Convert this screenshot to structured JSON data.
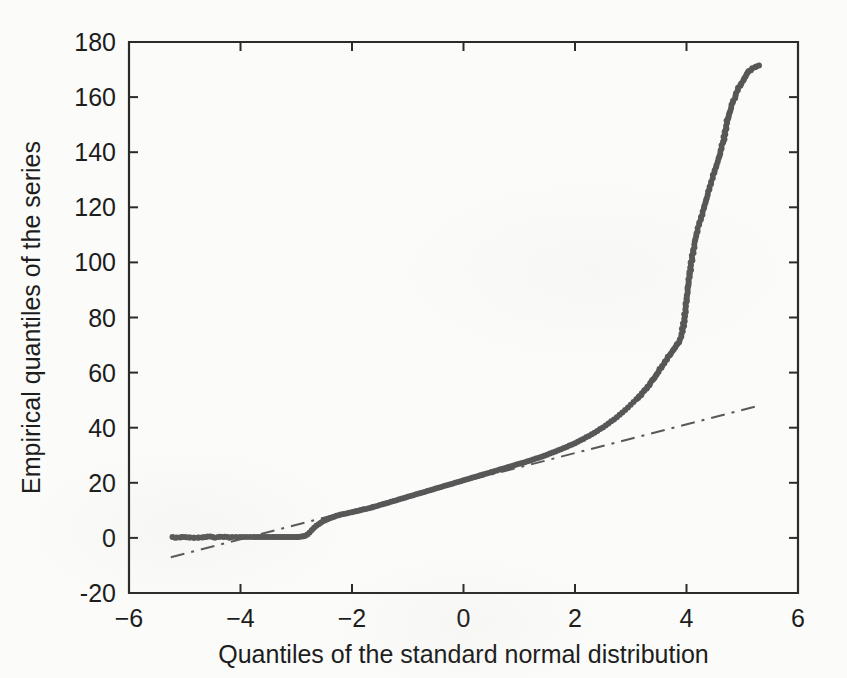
{
  "figure": {
    "background_color": "#fbfbf9",
    "axis_color": "#2b2b2b",
    "marker_color": "#575757",
    "reference_line_color": "#585858"
  },
  "chart_data": {
    "type": "scatter",
    "title": "",
    "xlabel": "Quantiles of the standard normal distribution",
    "ylabel": "Empirical quantiles of the series",
    "xlim": [
      -6,
      6
    ],
    "ylim": [
      -20,
      180
    ],
    "xticks": [
      -6,
      -4,
      -2,
      0,
      2,
      4,
      6
    ],
    "xticklabels": [
      "-6",
      "-4",
      "-2",
      "0",
      "2",
      "4",
      "6"
    ],
    "yticks": [
      -20,
      0,
      20,
      40,
      60,
      80,
      100,
      120,
      140,
      160,
      180
    ],
    "yticklabels": [
      "-20",
      "0",
      "20",
      "40",
      "60",
      "80",
      "100",
      "120",
      "140",
      "160",
      "180"
    ],
    "grid": false,
    "legend": null,
    "marker": "dot",
    "marker_size": 3.0,
    "series": [
      {
        "name": "Empirical quantiles",
        "type": "scatter",
        "points": [
          [
            -5.22,
            0.3
          ],
          [
            -5.05,
            0.3
          ],
          [
            -4.62,
            0.3
          ],
          [
            -4.5,
            0.3
          ],
          [
            -4.4,
            0.3
          ],
          [
            -4.31,
            0.3
          ],
          [
            -4.23,
            0.3
          ],
          [
            -4.15,
            0.3
          ],
          [
            -4.08,
            0.3
          ],
          [
            -4.01,
            0.3
          ],
          [
            -3.95,
            0.3
          ],
          [
            -3.89,
            0.3
          ],
          [
            -3.83,
            0.3
          ],
          [
            -3.77,
            0.3
          ],
          [
            -3.72,
            0.3
          ],
          [
            -3.67,
            0.3
          ],
          [
            -3.62,
            0.3
          ],
          [
            -3.57,
            0.3
          ],
          [
            -3.52,
            0.3
          ],
          [
            -3.48,
            0.3
          ],
          [
            -3.43,
            0.3
          ],
          [
            -3.39,
            0.3
          ],
          [
            -3.35,
            0.3
          ],
          [
            -3.31,
            0.3
          ],
          [
            -3.27,
            0.3
          ],
          [
            -3.23,
            0.3
          ],
          [
            -3.19,
            0.3
          ],
          [
            -3.15,
            0.3
          ],
          [
            -3.11,
            0.3
          ],
          [
            -3.08,
            0.3
          ],
          [
            -3.04,
            0.3
          ],
          [
            -3.0,
            0.3
          ],
          [
            -2.97,
            0.3
          ],
          [
            -2.94,
            0.4
          ],
          [
            -2.9,
            0.5
          ],
          [
            -2.87,
            0.6
          ],
          [
            -2.84,
            0.8
          ],
          [
            -2.8,
            1.2
          ],
          [
            -2.76,
            2.0
          ],
          [
            -2.72,
            2.9
          ],
          [
            -2.68,
            3.7
          ],
          [
            -2.64,
            4.4
          ],
          [
            -2.6,
            5.0
          ],
          [
            -2.56,
            5.5
          ],
          [
            -2.52,
            6.0
          ],
          [
            -2.48,
            6.4
          ],
          [
            -2.44,
            6.8
          ],
          [
            -2.4,
            7.1
          ],
          [
            -2.36,
            7.4
          ],
          [
            -2.32,
            7.7
          ],
          [
            -2.28,
            8.0
          ],
          [
            -2.24,
            8.2
          ],
          [
            -2.2,
            8.5
          ],
          [
            -2.15,
            8.7
          ],
          [
            -2.1,
            8.9
          ],
          [
            -2.05,
            9.1
          ],
          [
            -2.0,
            9.3
          ],
          [
            -1.95,
            9.6
          ],
          [
            -1.9,
            9.8
          ],
          [
            -1.85,
            10.0
          ],
          [
            -1.8,
            10.3
          ],
          [
            -1.75,
            10.5
          ],
          [
            -1.7,
            10.8
          ],
          [
            -1.65,
            11.0
          ],
          [
            -1.6,
            11.3
          ],
          [
            -1.55,
            11.6
          ],
          [
            -1.5,
            11.9
          ],
          [
            -1.45,
            12.2
          ],
          [
            -1.4,
            12.5
          ],
          [
            -1.35,
            12.8
          ],
          [
            -1.3,
            13.1
          ],
          [
            -1.25,
            13.4
          ],
          [
            -1.2,
            13.7
          ],
          [
            -1.15,
            14.0
          ],
          [
            -1.1,
            14.3
          ],
          [
            -1.05,
            14.6
          ],
          [
            -1.0,
            14.9
          ],
          [
            -0.95,
            15.2
          ],
          [
            -0.9,
            15.5
          ],
          [
            -0.85,
            15.8
          ],
          [
            -0.8,
            16.1
          ],
          [
            -0.75,
            16.4
          ],
          [
            -0.7,
            16.7
          ],
          [
            -0.65,
            17.0
          ],
          [
            -0.6,
            17.3
          ],
          [
            -0.55,
            17.6
          ],
          [
            -0.5,
            17.9
          ],
          [
            -0.45,
            18.2
          ],
          [
            -0.4,
            18.5
          ],
          [
            -0.35,
            18.8
          ],
          [
            -0.3,
            19.1
          ],
          [
            -0.25,
            19.4
          ],
          [
            -0.2,
            19.7
          ],
          [
            -0.15,
            20.0
          ],
          [
            -0.1,
            20.3
          ],
          [
            -0.05,
            20.6
          ],
          [
            0.0,
            20.9
          ],
          [
            0.05,
            21.2
          ],
          [
            0.1,
            21.5
          ],
          [
            0.15,
            21.8
          ],
          [
            0.2,
            22.1
          ],
          [
            0.25,
            22.4
          ],
          [
            0.3,
            22.7
          ],
          [
            0.35,
            23.0
          ],
          [
            0.4,
            23.3
          ],
          [
            0.45,
            23.6
          ],
          [
            0.5,
            23.9
          ],
          [
            0.55,
            24.2
          ],
          [
            0.6,
            24.5
          ],
          [
            0.65,
            24.8
          ],
          [
            0.7,
            25.1
          ],
          [
            0.75,
            25.4
          ],
          [
            0.8,
            25.7
          ],
          [
            0.85,
            26.0
          ],
          [
            0.9,
            26.3
          ],
          [
            0.95,
            26.6
          ],
          [
            1.0,
            26.9
          ],
          [
            1.05,
            27.2
          ],
          [
            1.1,
            27.5
          ],
          [
            1.15,
            27.8
          ],
          [
            1.2,
            28.1
          ],
          [
            1.25,
            28.5
          ],
          [
            1.3,
            28.8
          ],
          [
            1.35,
            29.1
          ],
          [
            1.4,
            29.5
          ],
          [
            1.45,
            29.8
          ],
          [
            1.5,
            30.2
          ],
          [
            1.55,
            30.6
          ],
          [
            1.6,
            31.0
          ],
          [
            1.65,
            31.4
          ],
          [
            1.7,
            31.8
          ],
          [
            1.75,
            32.2
          ],
          [
            1.8,
            32.6
          ],
          [
            1.85,
            33.0
          ],
          [
            1.9,
            33.5
          ],
          [
            1.95,
            33.9
          ],
          [
            2.0,
            34.4
          ],
          [
            2.05,
            34.9
          ],
          [
            2.1,
            35.4
          ],
          [
            2.15,
            35.9
          ],
          [
            2.2,
            36.5
          ],
          [
            2.25,
            37.0
          ],
          [
            2.3,
            37.6
          ],
          [
            2.35,
            38.2
          ],
          [
            2.4,
            38.8
          ],
          [
            2.45,
            39.5
          ],
          [
            2.5,
            40.1
          ],
          [
            2.55,
            40.8
          ],
          [
            2.6,
            41.5
          ],
          [
            2.65,
            42.3
          ],
          [
            2.7,
            43.0
          ],
          [
            2.75,
            43.8
          ],
          [
            2.8,
            44.7
          ],
          [
            2.85,
            45.5
          ],
          [
            2.9,
            46.4
          ],
          [
            2.95,
            47.3
          ],
          [
            3.0,
            48.3
          ],
          [
            3.05,
            49.3
          ],
          [
            3.1,
            50.3
          ],
          [
            3.15,
            51.4
          ],
          [
            3.2,
            52.5
          ],
          [
            3.25,
            53.7
          ],
          [
            3.3,
            54.9
          ],
          [
            3.35,
            56.2
          ],
          [
            3.4,
            57.5
          ],
          [
            3.45,
            58.9
          ],
          [
            3.5,
            60.3
          ],
          [
            3.55,
            61.8
          ],
          [
            3.6,
            63.3
          ],
          [
            3.65,
            64.8
          ],
          [
            3.7,
            66.3
          ],
          [
            3.75,
            67.8
          ],
          [
            3.8,
            69.2
          ],
          [
            3.84,
            70.5
          ],
          [
            3.88,
            72.0
          ],
          [
            3.91,
            74.0
          ],
          [
            3.94,
            76.5
          ],
          [
            3.96,
            79.5
          ],
          [
            3.98,
            83.0
          ],
          [
            4.0,
            86.5
          ],
          [
            4.02,
            90.0
          ],
          [
            4.04,
            93.0
          ],
          [
            4.06,
            96.0
          ],
          [
            4.08,
            99.0
          ],
          [
            4.1,
            101.5
          ],
          [
            4.12,
            104.0
          ],
          [
            4.14,
            106.5
          ],
          [
            4.16,
            108.5
          ],
          [
            4.18,
            110.5
          ],
          [
            4.2,
            112.5
          ],
          [
            4.23,
            114.5
          ],
          [
            4.26,
            116.5
          ],
          [
            4.29,
            118.5
          ],
          [
            4.32,
            120.5
          ],
          [
            4.35,
            122.5
          ],
          [
            4.38,
            124.5
          ],
          [
            4.41,
            126.5
          ],
          [
            4.44,
            128.5
          ],
          [
            4.47,
            130.5
          ],
          [
            4.5,
            132.5
          ],
          [
            4.53,
            134.5
          ],
          [
            4.56,
            136.5
          ],
          [
            4.59,
            138.5
          ],
          [
            4.61,
            140.5
          ],
          [
            4.63,
            142.5
          ],
          [
            4.66,
            144.0
          ],
          [
            4.7,
            148.0
          ],
          [
            4.71,
            149.5
          ],
          [
            4.74,
            152.0
          ],
          [
            4.76,
            153.5
          ],
          [
            4.8,
            156.0
          ],
          [
            4.83,
            158.0
          ],
          [
            4.88,
            160.5
          ],
          [
            4.92,
            162.5
          ],
          [
            4.97,
            164.5
          ],
          [
            5.02,
            166.0
          ],
          [
            5.06,
            167.5
          ],
          [
            5.12,
            169.5
          ],
          [
            5.18,
            170.5
          ],
          [
            5.3,
            171.5
          ]
        ]
      }
    ],
    "reference_line": {
      "name": "Normal reference line",
      "style": "dash-dot",
      "x": [
        -5.25,
        5.3
      ],
      "y": [
        -7.0,
        48.0
      ]
    }
  }
}
